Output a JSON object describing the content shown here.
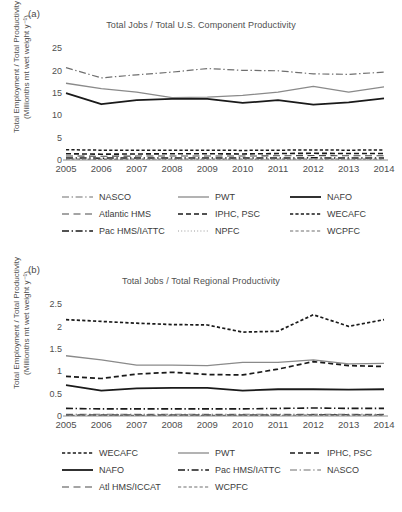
{
  "figure": {
    "ylabel_line1": "Total Employment / Total Productivity",
    "ylabel_line2": "(Millionths mt wet weight y⁻¹)"
  },
  "panels": [
    {
      "label": "(a)",
      "title": "Total Jobs / Total U.S. Component Productivity",
      "ylabel_line1": "Total Employment / Total Productivity",
      "ylabel_line2": "(Millionths mt wet weight y⁻¹)",
      "legend_rows": [
        [
          "NASCO",
          "PWT",
          "NAFO"
        ],
        [
          "Atlantic HMS",
          "IPHC, PSC",
          "WECAFC"
        ],
        [
          "Pac HMS/IATTC",
          "NPFC",
          "WCPFC"
        ]
      ]
    },
    {
      "label": "(b)",
      "title": "Total Jobs / Total Regional Productivity",
      "ylabel_line1": "Total Employment / Total Productivity",
      "ylabel_line2": "(Millionths mt wet weight y⁻¹)",
      "legend_rows": [
        [
          "WECAFC",
          "PWT",
          "IPHC, PSC"
        ],
        [
          "NAFO",
          "Pac HMS/IATTC",
          "NASCO"
        ],
        [
          "Atl HMS/ICCAT",
          "WCPFC",
          ""
        ]
      ]
    }
  ],
  "chart_data": [
    {
      "type": "line",
      "panel": "(a)",
      "title": "Total Jobs / Total U.S. Component Productivity",
      "xlabel": "",
      "ylabel": "Total Employment / Total Productivity (Millionths mt wet weight y⁻¹)",
      "x": [
        2005,
        2006,
        2007,
        2008,
        2009,
        2010,
        2011,
        2012,
        2013,
        2014
      ],
      "categories": [
        "2005",
        "2006",
        "2007",
        "2008",
        "2009",
        "2010",
        "2011",
        "2012",
        "2013",
        "2014"
      ],
      "yticks": [
        0,
        5,
        10,
        15,
        20,
        25
      ],
      "ylim": [
        0,
        26
      ],
      "grid": false,
      "legend_position": "below",
      "series": [
        {
          "name": "NASCO",
          "style": "dashdot",
          "color": "#6f6f6f",
          "width": 1.2,
          "values": [
            20.7,
            18.4,
            19.1,
            19.7,
            20.5,
            20.1,
            20.0,
            19.3,
            19.2,
            19.7
          ]
        },
        {
          "name": "PWT",
          "style": "solid",
          "color": "#8a8a8a",
          "width": 1.3,
          "values": [
            17.2,
            16.0,
            15.2,
            14.0,
            14.1,
            14.5,
            15.2,
            16.5,
            15.2,
            16.4
          ]
        },
        {
          "name": "NAFO",
          "style": "solid",
          "color": "#1a1a1a",
          "width": 1.8,
          "values": [
            15.0,
            12.5,
            13.4,
            13.7,
            13.7,
            12.8,
            13.4,
            12.4,
            12.9,
            13.8
          ]
        },
        {
          "name": "Atlantic HMS",
          "style": "dashed-long",
          "color": "#4a4a4a",
          "width": 1.1,
          "values": [
            0.9,
            0.85,
            0.88,
            0.9,
            0.9,
            0.88,
            0.95,
            1.0,
            0.95,
            0.95
          ]
        },
        {
          "name": "IPHC, PSC",
          "style": "dashed-med",
          "color": "#1a1a1a",
          "width": 1.6,
          "values": [
            1.4,
            1.3,
            1.35,
            1.4,
            1.4,
            1.35,
            1.45,
            1.5,
            1.45,
            1.45
          ]
        },
        {
          "name": "WECAFC",
          "style": "dashed-short",
          "color": "#1a1a1a",
          "width": 1.5,
          "values": [
            2.3,
            2.2,
            2.2,
            2.2,
            2.2,
            2.15,
            2.2,
            2.25,
            2.2,
            2.25
          ]
        },
        {
          "name": "Pac HMS/IATTC",
          "style": "dashdot",
          "color": "#1a1a1a",
          "width": 1.5,
          "values": [
            0.45,
            0.42,
            0.43,
            0.44,
            0.44,
            0.43,
            0.46,
            0.48,
            0.46,
            0.47
          ]
        },
        {
          "name": "NPFC",
          "style": "dotted",
          "color": "#9a9a9a",
          "width": 1.0,
          "values": [
            0.12,
            0.11,
            0.11,
            0.12,
            0.12,
            0.11,
            0.12,
            0.13,
            0.12,
            0.12
          ]
        },
        {
          "name": "WCPFC",
          "style": "dashed-short",
          "color": "#6f6f6f",
          "width": 1.1,
          "values": [
            0.22,
            0.2,
            0.21,
            0.22,
            0.22,
            0.21,
            0.23,
            0.24,
            0.23,
            0.23
          ]
        }
      ]
    },
    {
      "type": "line",
      "panel": "(b)",
      "title": "Total Jobs / Total Regional Productivity",
      "xlabel": "",
      "ylabel": "Total Employment / Total Productivity (Millionths mt wet weight y⁻¹)",
      "x": [
        2005,
        2006,
        2007,
        2008,
        2009,
        2010,
        2011,
        2012,
        2013,
        2014
      ],
      "categories": [
        "2005",
        "2006",
        "2007",
        "2008",
        "2009",
        "2010",
        "2011",
        "2012",
        "2013",
        "2014"
      ],
      "yticks": [
        0,
        0.5,
        1,
        1.5,
        2,
        2.5
      ],
      "ytick_labels": [
        "0",
        "0.5",
        "1",
        "1.5",
        "2",
        "2.5"
      ],
      "ylim": [
        0,
        2.6
      ],
      "grid": false,
      "legend_position": "below",
      "series": [
        {
          "name": "WECAFC",
          "style": "dashed-short",
          "color": "#1a1a1a",
          "width": 1.7,
          "values": [
            2.16,
            2.12,
            2.08,
            2.05,
            2.04,
            1.88,
            1.9,
            2.27,
            2.01,
            2.16
          ]
        },
        {
          "name": "PWT",
          "style": "solid",
          "color": "#8a8a8a",
          "width": 1.3,
          "values": [
            1.35,
            1.26,
            1.14,
            1.14,
            1.13,
            1.2,
            1.2,
            1.26,
            1.17,
            1.18
          ]
        },
        {
          "name": "IPHC, PSC",
          "style": "dashed-med",
          "color": "#1a1a1a",
          "width": 1.7,
          "values": [
            0.89,
            0.84,
            0.94,
            0.98,
            0.93,
            0.92,
            1.05,
            1.22,
            1.13,
            1.11
          ]
        },
        {
          "name": "NAFO",
          "style": "solid",
          "color": "#1a1a1a",
          "width": 1.8,
          "values": [
            0.69,
            0.57,
            0.62,
            0.63,
            0.63,
            0.57,
            0.6,
            0.6,
            0.59,
            0.6
          ]
        },
        {
          "name": "Pac HMS/IATTC",
          "style": "dashdot",
          "color": "#1a1a1a",
          "width": 1.6,
          "values": [
            0.17,
            0.16,
            0.16,
            0.16,
            0.16,
            0.16,
            0.17,
            0.18,
            0.17,
            0.17
          ]
        },
        {
          "name": "NASCO",
          "style": "dashdot",
          "color": "#6f6f6f",
          "width": 1.1,
          "values": [
            0.04,
            0.04,
            0.04,
            0.04,
            0.04,
            0.04,
            0.04,
            0.04,
            0.04,
            0.04
          ]
        },
        {
          "name": "Atl HMS/ICCAT",
          "style": "dashed-long",
          "color": "#4a4a4a",
          "width": 1.1,
          "values": [
            0.025,
            0.025,
            0.025,
            0.025,
            0.025,
            0.025,
            0.025,
            0.03,
            0.03,
            0.03
          ]
        },
        {
          "name": "WCPFC",
          "style": "dashed-short",
          "color": "#6f6f6f",
          "width": 1.1,
          "values": [
            0.015,
            0.015,
            0.015,
            0.015,
            0.015,
            0.015,
            0.015,
            0.02,
            0.02,
            0.02
          ]
        }
      ]
    }
  ]
}
